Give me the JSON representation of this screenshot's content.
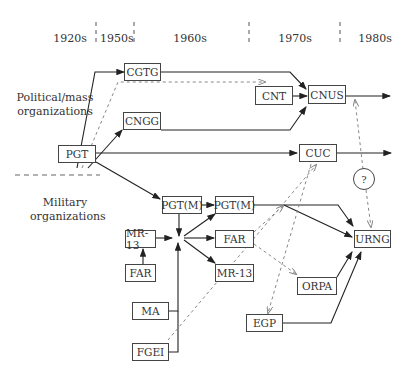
{
  "eras": [
    "1920s",
    "1950s",
    "1960s",
    "1970s",
    "1980s"
  ],
  "groups": {
    "political": "Political/mass organizations",
    "military": "Military organizations"
  },
  "nodes": {
    "pgt": "PGT",
    "cgtg": "CGTG",
    "cngg": "CNGG",
    "cnt": "CNT",
    "cnus": "CNUS",
    "cuc": "CUC",
    "pgtm1": "PGT(M)",
    "pgtm2": "PGT(M)",
    "mr13a": "MR-13",
    "far1": "FAR",
    "far2": "FAR",
    "mr13b": "MR-13",
    "ma": "MA",
    "fgei": "FGEI",
    "orpa": "ORPA",
    "egp": "EGP",
    "urng": "URNG",
    "unknown": "?"
  },
  "edges": [
    {
      "from": "PGT",
      "to": "CGTG",
      "style": "solid"
    },
    {
      "from": "PGT",
      "to": "CNT",
      "style": "dashed"
    },
    {
      "from": "PGT",
      "to": "CNGG",
      "style": "solid"
    },
    {
      "from": "PGT",
      "to": "CUC",
      "style": "solid"
    },
    {
      "from": "PGT",
      "to": "PGT(M)",
      "style": "solid"
    },
    {
      "from": "CGTG",
      "to": "CNUS",
      "style": "solid"
    },
    {
      "from": "CNT",
      "to": "CNUS",
      "style": "solid"
    },
    {
      "from": "CNGG",
      "to": "CNUS",
      "style": "solid"
    },
    {
      "from": "CNUS",
      "to": "1980s",
      "style": "solid"
    },
    {
      "from": "CUC",
      "to": "1980s",
      "style": "solid"
    },
    {
      "from": "?",
      "to": "CNUS",
      "style": "dashed"
    },
    {
      "from": "?",
      "to": "URNG",
      "style": "dashed"
    },
    {
      "from": "PGT(M)",
      "to": "junction",
      "style": "solid"
    },
    {
      "from": "MR-13",
      "to": "junction",
      "style": "solid"
    },
    {
      "from": "FAR",
      "to": "MR-13",
      "style": "solid"
    },
    {
      "from": "MA",
      "to": "junction",
      "style": "solid"
    },
    {
      "from": "FGEI",
      "to": "junction",
      "style": "solid"
    },
    {
      "from": "junction",
      "to": "PGT(M) 1960s",
      "style": "solid"
    },
    {
      "from": "junction",
      "to": "FAR 1960s",
      "style": "solid"
    },
    {
      "from": "junction",
      "to": "MR-13 1960s",
      "style": "solid"
    },
    {
      "from": "PGT(M)",
      "to": "PGT(M) 1960s",
      "style": "solid"
    },
    {
      "from": "PGT(M) 1960s",
      "to": "URNG",
      "style": "solid"
    },
    {
      "from": "FAR 1960s",
      "to": "URNG",
      "style": "solid"
    },
    {
      "from": "FAR 1960s",
      "to": "ORPA",
      "style": "dashed"
    },
    {
      "from": "FAR 1960s",
      "to": "PGT(M) line",
      "style": "dashed"
    },
    {
      "from": "FGEI",
      "to": "CUC",
      "style": "dashed"
    },
    {
      "from": "CUC",
      "to": "EGP",
      "style": "dashed"
    },
    {
      "from": "ORPA",
      "to": "URNG",
      "style": "solid"
    },
    {
      "from": "EGP",
      "to": "URNG",
      "style": "solid"
    }
  ]
}
